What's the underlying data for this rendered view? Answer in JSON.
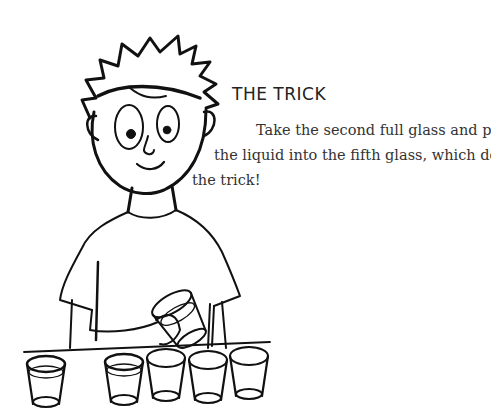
{
  "heading": "THE TRICK",
  "paragraph": {
    "line1": "Take the second full glass and pour",
    "line2": "the liquid into the fifth glass, which does",
    "line3": "the trick!"
  },
  "illustration": {
    "subject": "boy-pouring-glass",
    "glasses": [
      {
        "position": 1,
        "state": "full"
      },
      {
        "position": 2,
        "state": "lifted-being-poured"
      },
      {
        "position": 3,
        "state": "full"
      },
      {
        "position": 4,
        "state": "empty"
      },
      {
        "position": 5,
        "state": "empty"
      },
      {
        "position": 6,
        "state": "empty"
      }
    ]
  }
}
